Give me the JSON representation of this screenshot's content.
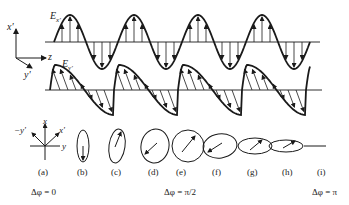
{
  "figure": {
    "wave_top": {
      "label": "E",
      "subscript": "x'"
    },
    "wave_bottom": {
      "label": "E",
      "subscript": "y'"
    },
    "axes_3d": {
      "x_label": "x'",
      "z_label": "z",
      "y_label": "y'"
    },
    "axes_2d": {
      "x_label": "x",
      "y_label": "y",
      "xprime_label": "x'",
      "neg_yprime_label": "−y'"
    },
    "panels": [
      {
        "id": "a",
        "label": "(a)",
        "shape": "axes"
      },
      {
        "id": "b",
        "label": "(b)",
        "shape": "ellipse"
      },
      {
        "id": "c",
        "label": "(c)",
        "shape": "ellipse"
      },
      {
        "id": "d",
        "label": "(d)",
        "shape": "ellipse"
      },
      {
        "id": "e",
        "label": "(e)",
        "shape": "circle"
      },
      {
        "id": "f",
        "label": "(f)",
        "shape": "ellipse"
      },
      {
        "id": "g",
        "label": "(g)",
        "shape": "ellipse"
      },
      {
        "id": "h",
        "label": "(h)",
        "shape": "ellipse"
      },
      {
        "id": "i",
        "label": "(i)",
        "shape": "line"
      }
    ],
    "phase_labels": [
      {
        "text": "Δφ = 0",
        "under": "a"
      },
      {
        "text": "Δφ = π/2",
        "under": "e"
      },
      {
        "text": "Δφ = π",
        "under": "i"
      }
    ],
    "colors": {
      "ink": "#1a1a1a",
      "background": "#ffffff"
    }
  }
}
